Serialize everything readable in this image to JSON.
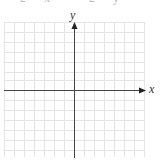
{
  "figure": {
    "type": "coordinate-grid",
    "top_fragment": "2x   2y",
    "x_axis_label": "x",
    "y_axis_label": "y",
    "grid": {
      "columns": 14,
      "rows": 13,
      "cell_size_px": 10,
      "line_color": "#e4e4e4",
      "axis_color": "#444444"
    }
  }
}
